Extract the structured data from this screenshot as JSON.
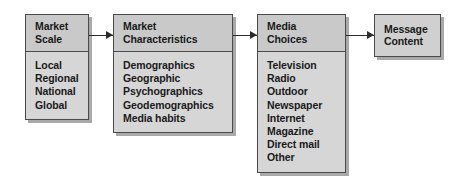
{
  "diagram": {
    "colors": {
      "box_fill": "#d6d6d6",
      "header_fill": "#c9c9c9",
      "border": "#4a4a4a",
      "shadow": "#8c8c8c",
      "arrow": "#2b2b2b",
      "text": "#1a1a1a",
      "background": "#ffffff"
    },
    "nodes": [
      {
        "id": "market-scale",
        "header_lines": [
          "Market",
          "Scale"
        ],
        "items": [
          "Local",
          "Regional",
          "National",
          "Global"
        ]
      },
      {
        "id": "market-characteristics",
        "header_lines": [
          "Market",
          "Characteristics"
        ],
        "items": [
          "Demographics",
          "Geographic",
          "Psychographics",
          "Geodemographics",
          "Media habits"
        ]
      },
      {
        "id": "media-choices",
        "header_lines": [
          "Media",
          "Choices"
        ],
        "items": [
          "Television",
          "Radio",
          "Outdoor",
          "Newspaper",
          "Internet",
          "Magazine",
          "Direct mail",
          "Other"
        ]
      },
      {
        "id": "message-content",
        "header_lines": [
          "Message",
          "Content"
        ],
        "items": []
      }
    ],
    "connectors": [
      {
        "id": "connector-1",
        "from": "market-scale",
        "to": "market-characteristics",
        "style": "arrow-right"
      },
      {
        "id": "connector-2",
        "from": "market-characteristics",
        "to": "media-choices",
        "style": "arrow-right"
      },
      {
        "id": "connector-3",
        "from": "media-choices",
        "to": "message-content",
        "style": "arrow-right"
      }
    ]
  }
}
